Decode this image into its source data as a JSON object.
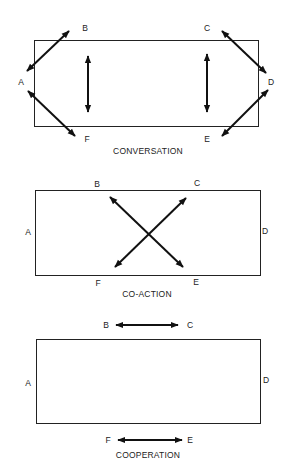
{
  "diagrams": [
    {
      "id": "conversation",
      "caption": "CONVERSATION",
      "caption_pos": [
        148,
        154
      ],
      "rect": {
        "x": 34,
        "y": 40,
        "w": 224,
        "h": 86
      },
      "labels": [
        {
          "text": "B",
          "x": 85,
          "y": 31
        },
        {
          "text": "C",
          "x": 207,
          "y": 31
        },
        {
          "text": "A",
          "x": 21,
          "y": 85
        },
        {
          "text": "D",
          "x": 271,
          "y": 85
        },
        {
          "text": "F",
          "x": 87,
          "y": 142
        },
        {
          "text": "E",
          "x": 207,
          "y": 142
        }
      ],
      "arrows": [
        {
          "from": "A",
          "to": "B",
          "x1": 27,
          "y1": 71,
          "x2": 69,
          "y2": 31
        },
        {
          "from": "A",
          "to": "F",
          "x1": 28,
          "y1": 91,
          "x2": 75,
          "y2": 136
        },
        {
          "from": "C",
          "to": "D",
          "x1": 222,
          "y1": 31,
          "x2": 266,
          "y2": 73
        },
        {
          "from": "D",
          "to": "E",
          "x1": 268,
          "y1": 90,
          "x2": 222,
          "y2": 136
        },
        {
          "from": "B",
          "to": "F",
          "x1": 88,
          "y1": 56,
          "x2": 88,
          "y2": 112
        },
        {
          "from": "C",
          "to": "E",
          "x1": 207,
          "y1": 54,
          "x2": 207,
          "y2": 112
        }
      ]
    },
    {
      "id": "co-action",
      "caption": "CO-ACTION",
      "caption_pos": [
        147,
        297
      ],
      "rect": {
        "x": 35,
        "y": 190,
        "w": 225,
        "h": 85
      },
      "labels": [
        {
          "text": "B",
          "x": 97,
          "y": 187
        },
        {
          "text": "C",
          "x": 197,
          "y": 186
        },
        {
          "text": "A",
          "x": 28,
          "y": 235
        },
        {
          "text": "D",
          "x": 265,
          "y": 234
        },
        {
          "text": "F",
          "x": 98,
          "y": 286
        },
        {
          "text": "E",
          "x": 196,
          "y": 285
        }
      ],
      "arrows": [
        {
          "from": "B",
          "to": "E",
          "x1": 110,
          "y1": 197,
          "x2": 183,
          "y2": 267
        },
        {
          "from": "C",
          "to": "F",
          "x1": 186,
          "y1": 198,
          "x2": 115,
          "y2": 267
        }
      ]
    },
    {
      "id": "cooperation",
      "caption": "COOPERATION",
      "caption_pos": [
        148,
        458
      ],
      "rect": {
        "x": 36,
        "y": 339,
        "w": 224,
        "h": 84
      },
      "labels": [
        {
          "text": "B",
          "x": 106,
          "y": 328
        },
        {
          "text": "C",
          "x": 190,
          "y": 328
        },
        {
          "text": "A",
          "x": 28,
          "y": 386
        },
        {
          "text": "D",
          "x": 266,
          "y": 383
        },
        {
          "text": "F",
          "x": 108,
          "y": 443
        },
        {
          "text": "E",
          "x": 190,
          "y": 443
        }
      ],
      "arrows": [
        {
          "from": "B",
          "to": "C",
          "x1": 116,
          "y1": 325,
          "x2": 178,
          "y2": 325
        },
        {
          "from": "F",
          "to": "E",
          "x1": 118,
          "y1": 440,
          "x2": 182,
          "y2": 440
        }
      ]
    }
  ],
  "colors": {
    "line": "#111111",
    "text": "#222222",
    "background": "#ffffff"
  }
}
